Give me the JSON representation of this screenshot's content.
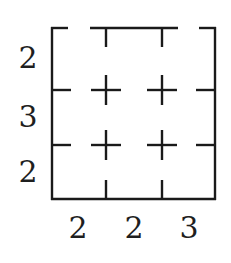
{
  "figure": {
    "kind": "grid-puzzle-diagram",
    "line_color": "#1a1a1a",
    "background_color": "#ffffff",
    "text_color": "#1f1f1f",
    "grid": {
      "columns": 3,
      "rows": 3,
      "left": 51,
      "top": 27,
      "right": 216,
      "bottom": 200,
      "column_dividers_x": [
        106,
        162
      ],
      "row_dividers_y": [
        90,
        145
      ]
    },
    "border_segments": [
      {
        "name": "top-left-stub",
        "x1": 51,
        "y1": 28,
        "x2": 67,
        "y2": 28
      },
      {
        "name": "top-middle-span",
        "x1": 91,
        "y1": 28,
        "x2": 177,
        "y2": 28
      },
      {
        "name": "top-right-stub",
        "x1": 200,
        "y1": 28,
        "x2": 216,
        "y2": 28
      },
      {
        "name": "bottom-edge",
        "x1": 51,
        "y1": 199,
        "x2": 216,
        "y2": 199
      },
      {
        "name": "left-edge",
        "x1": 52,
        "y1": 27,
        "x2": 52,
        "y2": 200
      },
      {
        "name": "right-edge",
        "x1": 215,
        "y1": 27,
        "x2": 215,
        "y2": 200
      }
    ],
    "tick_marks": [
      {
        "name": "top-tick-1",
        "edge": "top",
        "x1": 106,
        "y1": 28,
        "x2": 106,
        "y2": 46
      },
      {
        "name": "top-tick-2",
        "edge": "top",
        "x1": 162,
        "y1": 28,
        "x2": 162,
        "y2": 46
      },
      {
        "name": "bottom-tick-1",
        "edge": "bottom",
        "x1": 106,
        "y1": 181,
        "x2": 106,
        "y2": 199
      },
      {
        "name": "bottom-tick-2",
        "edge": "bottom",
        "x1": 162,
        "y1": 181,
        "x2": 162,
        "y2": 199
      },
      {
        "name": "left-tick-1",
        "edge": "left",
        "x1": 52,
        "y1": 90,
        "x2": 70,
        "y2": 90
      },
      {
        "name": "left-tick-2",
        "edge": "left",
        "x1": 52,
        "y1": 145,
        "x2": 70,
        "y2": 145
      },
      {
        "name": "right-tick-1",
        "edge": "right",
        "x1": 197,
        "y1": 90,
        "x2": 215,
        "y2": 90
      },
      {
        "name": "right-tick-2",
        "edge": "right",
        "x1": 197,
        "y1": 145,
        "x2": 215,
        "y2": 145
      }
    ],
    "interior_crosses": [
      {
        "name": "cross-top-left",
        "cx": 106,
        "cy": 90,
        "arm": 15
      },
      {
        "name": "cross-top-right",
        "cx": 162,
        "cy": 90,
        "arm": 15
      },
      {
        "name": "cross-bottom-left",
        "cx": 106,
        "cy": 145,
        "arm": 15
      },
      {
        "name": "cross-bottom-right",
        "cx": 162,
        "cy": 145,
        "arm": 15
      }
    ]
  },
  "row_clues": [
    {
      "label": "2",
      "x": 28,
      "y": 58
    },
    {
      "label": "3",
      "x": 28,
      "y": 117
    },
    {
      "label": "2",
      "x": 28,
      "y": 172
    }
  ],
  "column_clues": [
    {
      "label": "2",
      "x": 78,
      "y": 228
    },
    {
      "label": "2",
      "x": 134,
      "y": 228
    },
    {
      "label": "3",
      "x": 189,
      "y": 228
    }
  ]
}
